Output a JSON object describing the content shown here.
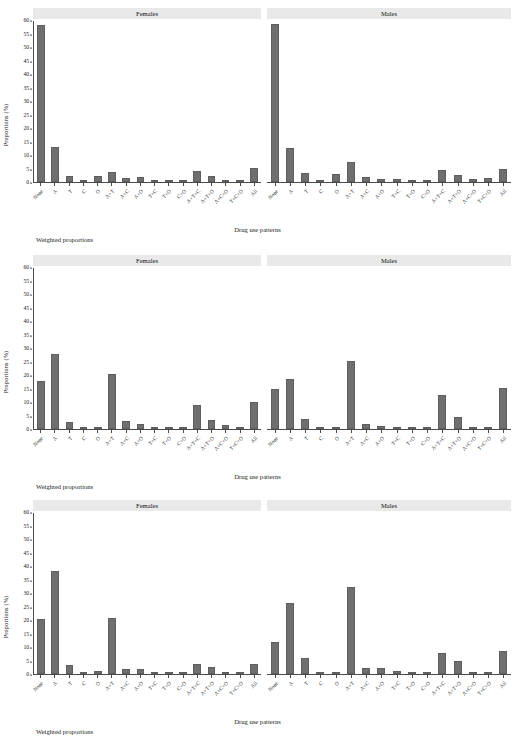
{
  "figure": {
    "axis_y_title": "Proportions (%)",
    "axis_x_title": "Drug use patterns",
    "footnote": "Weighted proportions",
    "panel_titles": {
      "females": "Females",
      "males": "Males"
    },
    "bar_color": "#6f6f6f",
    "strip_color": "#e9e9e9",
    "axis_color": "#4a4a4a"
  },
  "chart_data": [
    {
      "type": "bar",
      "title": "Weighted proportions",
      "xlabel": "Drug use patterns",
      "ylabel": "Proportions (%)",
      "ylim": [
        0,
        60
      ],
      "yticks": [
        0,
        5,
        10,
        15,
        20,
        25,
        30,
        35,
        40,
        45,
        50,
        55,
        60
      ],
      "grid": false,
      "legend": "none",
      "categories": [
        "None",
        "A",
        "T",
        "C",
        "O",
        "A+T",
        "A+C",
        "A+O",
        "T+C",
        "T+O",
        "C+O",
        "A+T+C",
        "A+T+O",
        "A+C+O",
        "T+C+O",
        "All"
      ],
      "panels": [
        {
          "name": "Females",
          "values": [
            58.5,
            13.0,
            2.3,
            0.2,
            2.3,
            3.6,
            1.5,
            1.8,
            0.1,
            0.0,
            0.0,
            4.0,
            2.1,
            0.9,
            0.0,
            5.3
          ]
        },
        {
          "name": "Males",
          "values": [
            58.9,
            12.6,
            3.2,
            0.1,
            3.0,
            7.3,
            1.7,
            1.2,
            1.2,
            0.0,
            0.0,
            4.5,
            2.5,
            1.3,
            1.4,
            4.8
          ]
        }
      ]
    },
    {
      "type": "bar",
      "title": "Weighted proportions",
      "xlabel": "Drug use patterns",
      "ylabel": "Proportions (%)",
      "ylim": [
        0,
        60
      ],
      "yticks": [
        0,
        5,
        10,
        15,
        20,
        25,
        30,
        35,
        40,
        45,
        50,
        55,
        60
      ],
      "grid": false,
      "legend": "none",
      "categories": [
        "None",
        "A",
        "T",
        "C",
        "O",
        "A+T",
        "A+C",
        "A+O",
        "T+C",
        "T+O",
        "C+O",
        "A+T+C",
        "A+T+O",
        "A+C+O",
        "T+C+O",
        "All"
      ],
      "panels": [
        {
          "name": "Females",
          "values": [
            18.0,
            28.1,
            2.6,
            0.1,
            0.3,
            20.5,
            3.0,
            1.7,
            0.1,
            0.0,
            0.0,
            8.8,
            3.2,
            1.4,
            0.0,
            10.2
          ]
        },
        {
          "name": "Males",
          "values": [
            14.8,
            18.8,
            3.8,
            0.1,
            0.2,
            25.4,
            1.8,
            1.1,
            0.8,
            0.0,
            0.0,
            12.7,
            4.3,
            0.7,
            0.0,
            15.2
          ]
        }
      ]
    },
    {
      "type": "bar",
      "title": "Weighted proportions",
      "xlabel": "Drug use patterns",
      "ylabel": "Proportions (%)",
      "ylim": [
        0,
        60
      ],
      "yticks": [
        0,
        5,
        10,
        15,
        20,
        25,
        30,
        35,
        40,
        45,
        50,
        55,
        60
      ],
      "grid": false,
      "legend": "none",
      "categories": [
        "None",
        "A",
        "T",
        "C",
        "O",
        "A+T",
        "A+C",
        "A+O",
        "T+C",
        "T+O",
        "C+O",
        "A+T+C",
        "A+T+O",
        "A+C+O",
        "T+C+O",
        "All"
      ],
      "panels": [
        {
          "name": "Females",
          "values": [
            20.4,
            38.3,
            3.4,
            0.1,
            1.1,
            21.0,
            1.9,
            1.9,
            0.0,
            0.4,
            0.0,
            3.8,
            2.8,
            0.5,
            0.0,
            3.9
          ]
        },
        {
          "name": "Males",
          "values": [
            11.8,
            26.6,
            6.0,
            0.1,
            0.8,
            32.5,
            2.2,
            2.3,
            1.1,
            0.0,
            0.0,
            7.7,
            4.7,
            0.8,
            0.0,
            8.6
          ]
        }
      ]
    }
  ]
}
